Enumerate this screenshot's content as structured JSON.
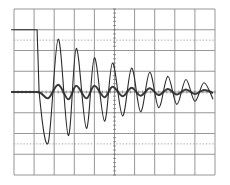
{
  "chart_data": {
    "type": "line",
    "title": "",
    "xlabel": "",
    "ylabel": "",
    "grid": true,
    "grid_divisions": {
      "x": 10,
      "y": 8
    },
    "legend": null,
    "xlim": [
      0,
      10
    ],
    "ylim": [
      -4,
      4
    ],
    "series": [
      {
        "name": "trace-1 (large damped ringing)",
        "description": "High level step (~+3.0 div) until x≈1.2 div, then drops and rings as a decaying oscillation about 0",
        "x": [
          0.0,
          1.15,
          1.25,
          1.7,
          2.2,
          2.7,
          3.1,
          3.6,
          4.0,
          4.5,
          4.9,
          5.4,
          5.85,
          6.3,
          6.75,
          7.2,
          7.65,
          8.1,
          8.55,
          9.0,
          9.45,
          9.9
        ],
        "values": [
          3.0,
          3.0,
          0.0,
          -2.45,
          2.55,
          -2.1,
          2.1,
          -1.75,
          1.65,
          -1.4,
          1.4,
          -1.15,
          1.15,
          -0.95,
          0.95,
          -0.75,
          0.75,
          -0.6,
          0.6,
          -0.45,
          0.45,
          -0.35
        ]
      },
      {
        "name": "trace-2 (small oscillation)",
        "description": "Small bold sinusoid about the centre line, approx 0.3 div amplitude, slowly decaying",
        "x": [
          0.0,
          1.2,
          1.7,
          2.2,
          2.7,
          3.1,
          3.6,
          4.0,
          4.5,
          4.9,
          5.4,
          5.85,
          6.3,
          6.75,
          7.2,
          7.65,
          8.1,
          8.55,
          9.0,
          9.45,
          9.9
        ],
        "values": [
          0.0,
          0.0,
          -0.3,
          0.35,
          -0.35,
          0.3,
          -0.3,
          0.3,
          -0.25,
          0.25,
          -0.2,
          0.2,
          -0.18,
          0.18,
          -0.15,
          0.15,
          -0.12,
          0.12,
          -0.1,
          0.1,
          -0.05
        ]
      }
    ],
    "annotations": []
  },
  "plot": {
    "left": 14,
    "top": 9,
    "width": 201,
    "height": 166,
    "colors": {
      "background": "#ffffff",
      "grid": "#8a8a8a",
      "trace": "#2a2a2a"
    }
  }
}
